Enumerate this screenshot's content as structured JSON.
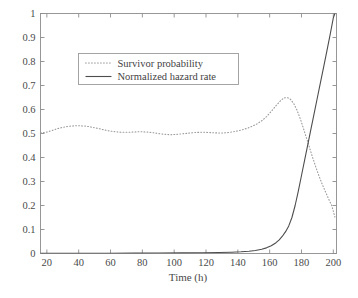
{
  "chart_data": {
    "type": "line",
    "title": "",
    "xlabel": "Time (h)",
    "ylabel": "",
    "xlim": [
      16,
      202
    ],
    "ylim": [
      0,
      1
    ],
    "grid": false,
    "legend_position": "upper-left",
    "xticks": [
      20,
      40,
      60,
      80,
      100,
      120,
      140,
      160,
      180,
      200
    ],
    "xtick_labels": [
      "20",
      "40",
      "60",
      "80",
      "100",
      "120",
      "140",
      "160",
      "180",
      "200"
    ],
    "yticks": [
      0,
      0.1,
      0.2,
      0.3,
      0.4,
      0.5,
      0.6,
      0.7,
      0.8,
      0.9,
      1
    ],
    "ytick_labels": [
      "0",
      "0.1",
      "0.2",
      "0.3",
      "0.4",
      "0.5",
      "0.6",
      "0.7",
      "0.8",
      "0.9",
      "1"
    ],
    "series": [
      {
        "name": "Survivor probability",
        "style": "dotted",
        "color": "#9a9a9a",
        "x": [
          16,
          18,
          20,
          23,
          26,
          29,
          32,
          35,
          38,
          41,
          44,
          47,
          50,
          53,
          56,
          59,
          62,
          65,
          68,
          71,
          74,
          77,
          80,
          83,
          86,
          89,
          92,
          95,
          98,
          101,
          104,
          107,
          110,
          113,
          116,
          119,
          122,
          125,
          128,
          131,
          134,
          137,
          140,
          143,
          146,
          149,
          152,
          155,
          158,
          161,
          164,
          167,
          169,
          171,
          173,
          175,
          177,
          179,
          181,
          183,
          185,
          187,
          189,
          191,
          193,
          195,
          197,
          199,
          201
        ],
        "y": [
          0.503,
          0.504,
          0.506,
          0.512,
          0.519,
          0.524,
          0.528,
          0.531,
          0.532,
          0.532,
          0.531,
          0.528,
          0.524,
          0.52,
          0.515,
          0.511,
          0.508,
          0.506,
          0.505,
          0.505,
          0.506,
          0.507,
          0.507,
          0.506,
          0.504,
          0.501,
          0.498,
          0.496,
          0.495,
          0.496,
          0.498,
          0.5,
          0.502,
          0.504,
          0.505,
          0.505,
          0.504,
          0.503,
          0.502,
          0.502,
          0.504,
          0.507,
          0.511,
          0.516,
          0.522,
          0.53,
          0.54,
          0.553,
          0.57,
          0.592,
          0.616,
          0.638,
          0.648,
          0.65,
          0.643,
          0.626,
          0.6,
          0.566,
          0.526,
          0.484,
          0.442,
          0.4,
          0.36,
          0.323,
          0.289,
          0.258,
          0.228,
          0.2,
          0.152
        ]
      },
      {
        "name": "Normalized hazard rate",
        "style": "solid",
        "color": "#4d4d4d",
        "x": [
          16,
          30,
          45,
          60,
          75,
          90,
          105,
          118,
          128,
          136,
          142,
          147,
          151,
          155,
          158,
          161,
          164,
          166,
          168,
          170,
          172,
          174,
          176,
          178,
          180,
          182,
          184,
          186,
          188,
          190,
          192,
          194,
          196,
          198,
          200,
          201
        ],
        "y": [
          0.0008,
          0.0009,
          0.001,
          0.0012,
          0.0014,
          0.0018,
          0.0024,
          0.0032,
          0.0042,
          0.0055,
          0.0072,
          0.0095,
          0.0125,
          0.0175,
          0.0235,
          0.032,
          0.045,
          0.057,
          0.072,
          0.091,
          0.115,
          0.15,
          0.2,
          0.26,
          0.325,
          0.39,
          0.455,
          0.52,
          0.585,
          0.65,
          0.715,
          0.78,
          0.845,
          0.912,
          0.982,
          1.0
        ]
      }
    ]
  },
  "legend": {
    "entries": [
      {
        "label": "Survivor probability",
        "style": "dotted"
      },
      {
        "label": "Normalized hazard rate",
        "style": "solid"
      }
    ]
  },
  "axes": {
    "x_title": "Time (h)"
  },
  "colors": {
    "axis": "#8d8d8d",
    "solid_series": "#4d4d4d",
    "dotted_series": "#9a9a9a",
    "background": "#ffffff"
  }
}
